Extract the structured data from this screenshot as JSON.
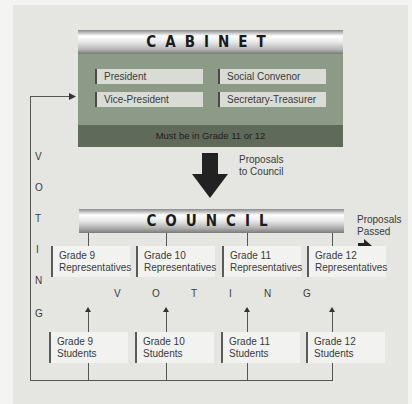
{
  "cabinet": {
    "title": "CABINET",
    "roles": [
      "President",
      "Social Convenor",
      "Vice-President",
      "Secretary-Treasurer"
    ],
    "requirement": "Must be in Grade 11 or 12"
  },
  "flow": {
    "proposals_to_council": [
      "Proposals",
      "to Council"
    ],
    "proposals_passed": [
      "Proposals",
      "Passed"
    ]
  },
  "council": {
    "title": "COUNCIL",
    "representatives": [
      {
        "grade": "Grade 9",
        "label": "Representatives"
      },
      {
        "grade": "Grade 10",
        "label": "Representatives"
      },
      {
        "grade": "Grade 11",
        "label": "Representatives"
      },
      {
        "grade": "Grade 12",
        "label": "Representatives"
      }
    ]
  },
  "voting": {
    "horizontal_letters": [
      "V",
      "O",
      "T",
      "I",
      "N",
      "G"
    ],
    "vertical_letters": [
      "V",
      "O",
      "T",
      "I",
      "N",
      "G"
    ]
  },
  "students": [
    {
      "grade": "Grade 9",
      "label": "Students"
    },
    {
      "grade": "Grade 10",
      "label": "Students"
    },
    {
      "grade": "Grade 11",
      "label": "Students"
    },
    {
      "grade": "Grade 12",
      "label": "Students"
    }
  ]
}
